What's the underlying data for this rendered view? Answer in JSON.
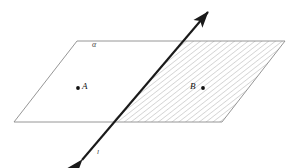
{
  "figure": {
    "canvas": {
      "width": 295,
      "height": 168
    },
    "background_color": "#ffffff"
  },
  "plane": {
    "name": "alpha",
    "label": "α",
    "label_position": {
      "x": 92,
      "y": 41
    },
    "outline_color": "#8a8a8a",
    "fill_color": "#ffffff",
    "corners": {
      "top_left": {
        "x": 77,
        "y": 41
      },
      "top_right": {
        "x": 285,
        "y": 41
      },
      "bottom_right": {
        "x": 222,
        "y": 122
      },
      "bottom_left": {
        "x": 14,
        "y": 122
      }
    }
  },
  "line": {
    "label": "l",
    "label_position": {
      "x": 97,
      "y": 149
    },
    "color": "#1a1a1a",
    "stroke_width": 2.1,
    "start": {
      "x": 82,
      "y": 160
    },
    "end": {
      "x": 208,
      "y": 12
    },
    "arrowheads": [
      "start",
      "end"
    ],
    "intersection_bottom_edge": {
      "x": 112,
      "y": 122
    },
    "intersection_top_edge": {
      "x": 183,
      "y": 41
    }
  },
  "hatched_region": {
    "description": "Portion of plane alpha to the right of the line, filled with diagonal hatching",
    "hatch_color": "#9a9a9a",
    "hatch_spacing": 4.2,
    "hatch_stroke_width": 0.7,
    "polygon": [
      {
        "x": 112,
        "y": 122
      },
      {
        "x": 183,
        "y": 41
      },
      {
        "x": 285,
        "y": 41
      },
      {
        "x": 222,
        "y": 122
      }
    ]
  },
  "points": [
    {
      "label": "A",
      "dot_position": {
        "x": 78,
        "y": 88
      },
      "label_position": {
        "x": 82,
        "y": 82
      },
      "dot_side": "left",
      "color": "#111111",
      "region": "unshaded"
    },
    {
      "label": "B",
      "dot_position": {
        "x": 203,
        "y": 88
      },
      "label_position": {
        "x": 190,
        "y": 82
      },
      "dot_side": "right",
      "color": "#111111",
      "region": "hatched"
    }
  ]
}
